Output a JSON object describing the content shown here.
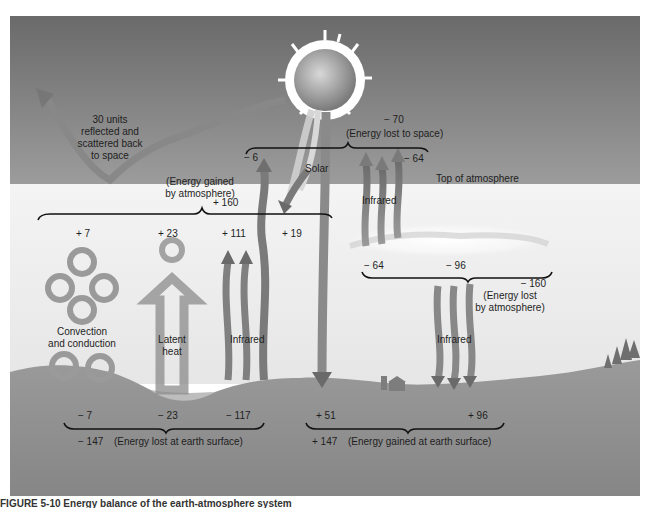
{
  "diagram": {
    "title_region_labels": {
      "top_of_atmosphere": "Top of atmosphere",
      "sun_label": "Solar"
    },
    "reflected": {
      "lines": [
        "30 units",
        "reflected and",
        "scattered back",
        "to space"
      ]
    },
    "space": {
      "total": "− 70",
      "total_label": "(Energy lost to space)",
      "atmosphere_direct": "− 6",
      "atmosphere_infrared": "− 64",
      "infrared_label": "Infrared"
    },
    "atmosphere_gain": {
      "label_lines": [
        "(Energy gained",
        "by atmosphere)"
      ],
      "total": "+ 160",
      "items": [
        {
          "value": "+ 7",
          "label_lines": [
            "Convection",
            "and conduction"
          ]
        },
        {
          "value": "+ 23",
          "label_lines": [
            "Latent",
            "heat"
          ]
        },
        {
          "value": "+ 111",
          "label_lines": [
            "Infrared"
          ]
        },
        {
          "value": "+ 19",
          "label_lines": []
        }
      ]
    },
    "atmosphere_loss": {
      "items": [
        {
          "value": "− 64"
        },
        {
          "value": "− 96"
        }
      ],
      "total": "− 160",
      "label_lines": [
        "(Energy lost",
        "by atmosphere)"
      ],
      "infrared_label": "Infrared"
    },
    "surface_loss": {
      "items": [
        "− 7",
        "− 23",
        "− 117"
      ],
      "total": "− 147",
      "total_label": "(Energy lost at earth surface)"
    },
    "surface_gain": {
      "items": [
        "+ 51",
        "+ 96"
      ],
      "total": "+ 147",
      "total_label": "(Energy gained at earth surface)"
    },
    "caption": "FIGURE 5-10  Energy balance of the earth-atmosphere system"
  },
  "colors": {
    "sky_top": "#6e6e6e",
    "sky_bottom": "#9a9a9a",
    "atmosphere": "#ececec",
    "ground": "#8c8c8c",
    "arrow": "#7a7a7a",
    "bracket": "#111111"
  }
}
